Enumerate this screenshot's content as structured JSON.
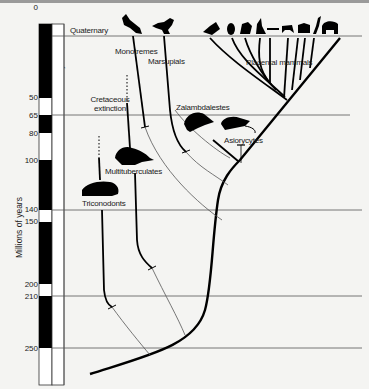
{
  "diagram": {
    "y_axis_label": "Millions of years",
    "ticks": [
      "0",
      "50",
      "65",
      "80",
      "100",
      "140",
      "150",
      "200",
      "210",
      "250"
    ],
    "periods": [
      "Quaternary",
      "Tertiary",
      "Cretaceous",
      "Jurassic",
      "Triassic"
    ],
    "annotations": {
      "cretaceous_extinction_line1": "Cretaceous",
      "cretaceous_extinction_line2": "extinction"
    },
    "lineages": {
      "monotremes": "Monotremes",
      "marsupials": "Marsupials",
      "placental": "Placental mammals",
      "zalambdalestes": "Zalambdalestes",
      "asiorycytes": "Asiorycytes",
      "multituberculates": "Multituberculates",
      "triconodonts": "Triconodonts"
    },
    "icons": [
      "platypus-silhouette-icon",
      "kangaroo-silhouette-icon",
      "placental-mammal-silhouettes-icon",
      "zalambdalestes-silhouette-icon",
      "asiorycytes-silhouette-icon",
      "multituberculate-silhouette-icon",
      "triconodont-silhouette-icon"
    ]
  }
}
